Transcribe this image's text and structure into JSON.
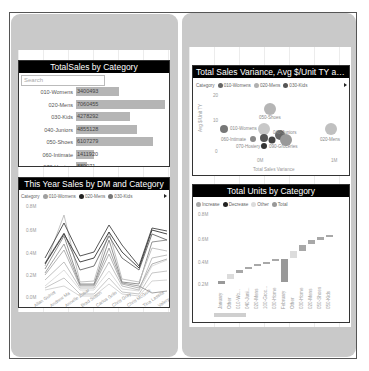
{
  "left_phone": {
    "visual1": {
      "title": "TotalSales by Category",
      "search_placeholder": "Search",
      "rows": [
        {
          "label": "010-Womens",
          "value": "3400493",
          "width": 43
        },
        {
          "label": "020-Mens",
          "value": "7060455",
          "width": 89
        },
        {
          "label": "030-Kids",
          "value": "4278292",
          "width": 54
        },
        {
          "label": "040-Juniors",
          "value": "4855128",
          "width": 61
        },
        {
          "label": "050-Shoes",
          "value": "6107279",
          "width": 77
        },
        {
          "label": "060-Intimate",
          "value": "1411920",
          "width": 18
        },
        {
          "label": "070-Hosiery",
          "value": "889071",
          "width": 11
        }
      ]
    },
    "visual2": {
      "title": "This Year Sales by DM and Category",
      "legend_title": "Category",
      "legend_items": [
        {
          "label": "010-Womens",
          "color": "#a0a0a0"
        },
        {
          "label": "020-Mens",
          "color": "#222222"
        },
        {
          "label": "030-Kids",
          "color": "#777777"
        }
      ],
      "y_ticks": [
        "0.8M",
        "0.6M",
        "0.4M",
        "0.2M",
        "0.0M"
      ],
      "x_labels": [
        "Allan Guinot",
        "Andrew Ma",
        "Annelie Zubar",
        "Brad Sutton",
        "Carlos Grilo",
        "Chris Gray",
        "Chris McGurk",
        "Tina Lassila",
        "Valery Ushakov"
      ]
    }
  },
  "right_phone": {
    "visual3": {
      "title": "Total Sales Variance, Avg $/Unit TY and Thi...",
      "legend_title": "Category",
      "legend_items": [
        {
          "label": "010-Womens",
          "color": "#666666"
        },
        {
          "label": "020-Mens",
          "color": "#b0b0b0"
        },
        {
          "label": "030-Kids",
          "color": "#555555"
        }
      ],
      "y_axis_label": "Avg $/Unit TY",
      "x_axis_label": "Total Sales Variance",
      "y_ticks": [
        "20",
        "10",
        "0"
      ],
      "x_ticks": [
        "0M",
        "1M"
      ],
      "point_labels": [
        "050-Shoes",
        "010-Womens",
        "040-Juniors",
        "020-Mens",
        "060-Intimate",
        "070-Hosiery",
        "090-Groceries"
      ]
    },
    "visual4": {
      "title": "Total Units by Category",
      "legend_items": [
        {
          "label": "Increase",
          "color": "#a8a8a8"
        },
        {
          "label": "Decrease",
          "color": "#222222"
        },
        {
          "label": "Other",
          "color": "#dcdcdc"
        },
        {
          "label": "Total",
          "color": "#999999"
        }
      ],
      "y_ticks": [
        "0.8M",
        "0.6M",
        "0.4M",
        "0.2M"
      ],
      "x_labels": [
        "January",
        "Other",
        "010-Wo...",
        "040-Juni...",
        "020-Mens",
        "100-Groc...",
        "030-Home",
        "February",
        "Other",
        "030-Home",
        "020-Mens",
        "050-Shoes",
        "050-Kids"
      ]
    }
  },
  "chart_data": [
    {
      "type": "bar",
      "title": "TotalSales by Category",
      "categories": [
        "010-Womens",
        "020-Mens",
        "030-Kids",
        "040-Juniors",
        "050-Shoes",
        "060-Intimate",
        "070-Hosiery"
      ],
      "values": [
        3400493,
        7060455,
        4278292,
        4855128,
        6107279,
        1411920,
        889071
      ]
    },
    {
      "type": "line",
      "title": "This Year Sales by DM and Category",
      "ylim": [
        0,
        800000
      ],
      "categories": [
        "Allan Guinot",
        "Andrew Ma",
        "Annelie Zubar",
        "Brad Sutton",
        "Carlos Grilo",
        "Chris Gray",
        "Chris McGurk",
        "Tina Lassila",
        "Valery Ushakov"
      ]
    },
    {
      "type": "scatter",
      "title": "Total Sales Variance, Avg $/Unit TY and This Year Sales",
      "xlabel": "Total Sales Variance",
      "ylabel": "Avg $/Unit TY",
      "ylim": [
        0,
        20
      ]
    },
    {
      "type": "bar",
      "title": "Total Units by Category",
      "categories": [
        "January",
        "Other",
        "010-Wo...",
        "040-Juni...",
        "020-Mens",
        "100-Groc...",
        "030-Home",
        "February",
        "Other",
        "030-Home",
        "020-Mens",
        "050-Shoes",
        "050-Kids"
      ]
    }
  ]
}
